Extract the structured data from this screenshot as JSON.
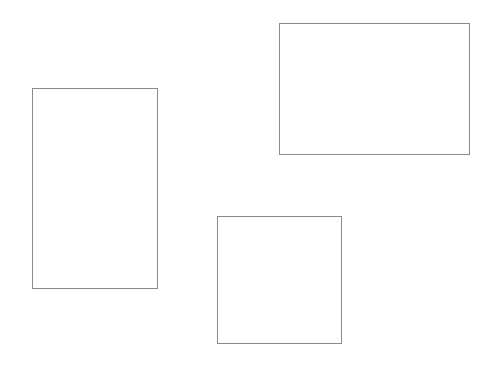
{
  "canvas": {
    "width": 494,
    "height": 370,
    "background_color": "#ffffff",
    "title": "Three outlined rectangles on a white background"
  },
  "style": {
    "stroke_color": "#8a8a8a",
    "stroke_width_px": 1,
    "fill": "none"
  },
  "shapes": [
    {
      "id": "rect-left-portrait",
      "label": "Left portrait rectangle",
      "kind": "rectangle",
      "orientation": "portrait",
      "x": 32,
      "y": 88,
      "width": 126,
      "height": 201,
      "stroke_color": "#8a8a8a",
      "fill": "none"
    },
    {
      "id": "rect-top-right-landscape",
      "label": "Top right landscape rectangle",
      "kind": "rectangle",
      "orientation": "landscape",
      "x": 279,
      "y": 23,
      "width": 191,
      "height": 132,
      "stroke_color": "#8a8a8a",
      "fill": "none"
    },
    {
      "id": "rect-bottom-center-square",
      "label": "Bottom center square",
      "kind": "square",
      "orientation": "square",
      "x": 217,
      "y": 216,
      "width": 125,
      "height": 128,
      "stroke_color": "#8a8a8a",
      "fill": "none"
    }
  ]
}
